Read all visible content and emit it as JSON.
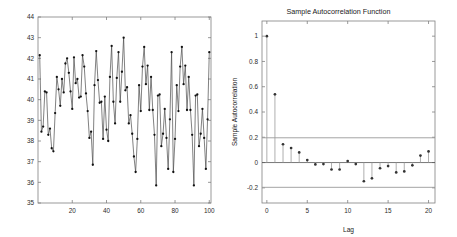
{
  "figure": {
    "background_color": "#ffffff",
    "panels": [
      "time-series",
      "autocorrelation"
    ]
  },
  "chart_data": [
    {
      "type": "line",
      "id": "time-series",
      "title": "",
      "xlabel": "",
      "ylabel": "",
      "xlim": [
        0,
        101
      ],
      "ylim": [
        35,
        44
      ],
      "xticks": [
        20,
        40,
        60,
        80,
        100
      ],
      "xticklabels": [
        "20",
        "40",
        "60",
        "80",
        "100"
      ],
      "yticks": [
        35,
        36,
        37,
        38,
        39,
        40,
        41,
        42,
        43,
        44
      ],
      "yticklabels": [
        "35",
        "36",
        "37",
        "38",
        "39",
        "40",
        "41",
        "42",
        "43",
        "44"
      ],
      "grid": false,
      "legend": "none",
      "marker": "dot",
      "line_color": "#4a4a4a",
      "marker_color": "#111111",
      "x": [
        1,
        2,
        3,
        4,
        5,
        6,
        7,
        8,
        9,
        10,
        11,
        12,
        13,
        14,
        15,
        16,
        17,
        18,
        19,
        20,
        21,
        22,
        23,
        24,
        25,
        26,
        27,
        28,
        29,
        30,
        31,
        32,
        33,
        34,
        35,
        36,
        37,
        38,
        39,
        40,
        41,
        42,
        43,
        44,
        45,
        46,
        47,
        48,
        49,
        50,
        51,
        52,
        53,
        54,
        55,
        56,
        57,
        58,
        59,
        60,
        61,
        62,
        63,
        64,
        65,
        66,
        67,
        68,
        69,
        70,
        71,
        72,
        73,
        74,
        75,
        76,
        77,
        78,
        79,
        80,
        81,
        82,
        83,
        84,
        85,
        86,
        87,
        88,
        89,
        90,
        91,
        92,
        93,
        94,
        95,
        96,
        97,
        98,
        99,
        100
      ],
      "values": [
        42.15,
        38.45,
        38.7,
        40.4,
        40.35,
        38.3,
        38.6,
        37.65,
        37.5,
        39.35,
        41.1,
        40.5,
        39.7,
        41.0,
        40.35,
        41.75,
        42.0,
        41.3,
        40.4,
        39.55,
        42.05,
        40.8,
        41.0,
        40.1,
        40.15,
        42.15,
        41.6,
        40.3,
        39.45,
        38.15,
        38.45,
        36.85,
        40.7,
        42.35,
        40.95,
        39.85,
        39.9,
        38.1,
        40.15,
        38.55,
        38.0,
        41.1,
        42.6,
        39.9,
        38.85,
        41.05,
        42.3,
        39.9,
        41.35,
        43.0,
        40.45,
        40.6,
        38.85,
        39.25,
        38.35,
        37.25,
        36.5,
        38.1,
        40.7,
        39.45,
        41.6,
        42.55,
        40.75,
        41.65,
        39.5,
        41.1,
        39.5,
        38.3,
        35.85,
        40.2,
        40.25,
        37.75,
        38.35,
        39.55,
        38.15,
        36.65,
        39.05,
        42.3
      ],
      "note_series": "100 observations; markers at each sample"
    },
    {
      "type": "stem",
      "id": "autocorrelation",
      "title": "Sample Autocorrelation Function",
      "xlabel": "Lag",
      "ylabel": "Sample Autocorrelation",
      "xlim": [
        -0.6,
        20.8
      ],
      "ylim": [
        -0.32,
        1.12
      ],
      "xticks": [
        0,
        5,
        10,
        15,
        20
      ],
      "xticklabels": [
        "0",
        "5",
        "10",
        "15",
        "20"
      ],
      "yticks": [
        -0.2,
        0,
        0.2,
        0.4,
        0.6,
        0.8,
        1
      ],
      "yticklabels": [
        "-0.2",
        "0",
        "0.2",
        "0.4",
        "0.6",
        "0.8",
        "1"
      ],
      "grid": false,
      "legend": "none",
      "confidence_bounds": [
        0.196,
        -0.196
      ],
      "bound_color": "#9a9a9a",
      "stem_color": "#9a9a9a",
      "marker_color": "#333333",
      "lags": [
        0,
        1,
        2,
        3,
        4,
        5,
        6,
        7,
        8,
        9,
        10,
        11,
        12,
        13,
        14,
        15,
        16,
        17,
        18,
        19,
        20
      ],
      "values": [
        1.0,
        0.54,
        0.145,
        0.115,
        0.08,
        0.02,
        -0.015,
        -0.012,
        -0.055,
        -0.055,
        0.012,
        -0.012,
        -0.148,
        -0.125,
        -0.045,
        -0.028,
        -0.078,
        -0.07,
        -0.022,
        0.055,
        0.088
      ]
    }
  ]
}
